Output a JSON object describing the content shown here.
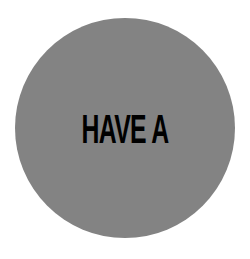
{
  "badge": {
    "text": "HAVE A",
    "background_color": "#ffffff",
    "disc_color": "#838383",
    "text_color": "#000000"
  }
}
